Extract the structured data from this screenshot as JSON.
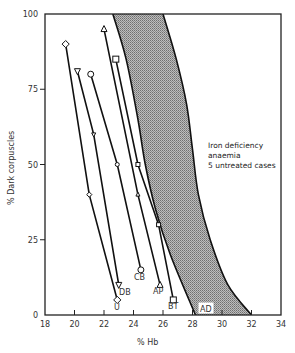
{
  "chart_data": {
    "type": "line",
    "title": "",
    "xlabel": "% Hb",
    "ylabel": "% Dark corpuscles",
    "xlim": [
      18,
      34
    ],
    "ylim": [
      0,
      100
    ],
    "xticks": [
      18,
      20,
      22,
      24,
      26,
      28,
      30,
      32,
      34
    ],
    "yticks": [
      0,
      25,
      50,
      75,
      100
    ],
    "grid": false,
    "series": [
      {
        "name": "U",
        "marker": "diamond",
        "points": [
          [
            19.4,
            90
          ],
          [
            21.0,
            40
          ],
          [
            22.9,
            5
          ]
        ]
      },
      {
        "name": "DB",
        "marker": "triangle-down",
        "points": [
          [
            20.2,
            81
          ],
          [
            21.3,
            60
          ],
          [
            23.0,
            10
          ]
        ]
      },
      {
        "name": "CB",
        "marker": "circle",
        "points": [
          [
            21.1,
            80
          ],
          [
            22.9,
            50
          ],
          [
            24.5,
            15
          ]
        ]
      },
      {
        "name": "AP",
        "marker": "triangle",
        "points": [
          [
            22.0,
            95
          ],
          [
            24.3,
            40
          ],
          [
            25.8,
            10
          ]
        ]
      },
      {
        "name": "BT",
        "marker": "square",
        "points": [
          [
            22.8,
            85
          ],
          [
            24.3,
            50
          ],
          [
            25.7,
            30
          ],
          [
            26.7,
            5
          ]
        ]
      }
    ],
    "shaded_region": {
      "name": "AD",
      "description": "Iron deficiency anaemia, 5 untreated cases",
      "left_edge": [
        [
          22.6,
          100
        ],
        [
          23.5,
          85
        ],
        [
          24.3,
          65
        ],
        [
          24.8,
          50
        ],
        [
          25.5,
          35
        ],
        [
          26.5,
          20
        ],
        [
          28.2,
          0
        ]
      ],
      "right_edge": [
        [
          26.0,
          100
        ],
        [
          26.9,
          85
        ],
        [
          27.6,
          70
        ],
        [
          28.0,
          55
        ],
        [
          28.4,
          40
        ],
        [
          29.2,
          25
        ],
        [
          30.4,
          10
        ],
        [
          32.0,
          0
        ]
      ],
      "fill": "#9a9a9a"
    },
    "annotations": [
      {
        "text": "Iron deficiency",
        "x": 28.6,
        "y": 52
      },
      {
        "text": "anaemia",
        "x": 28.6,
        "y": 47.5
      },
      {
        "text": "5 untreated cases",
        "x": 28.6,
        "y": 43
      }
    ]
  },
  "labels": {
    "xlabel": "% Hb",
    "ylabel": "% Dark corpuscles",
    "annotation_line1": "Iron deficiency",
    "annotation_line2": "anaemia",
    "annotation_line3": "5 untreated cases",
    "region_label": "AD",
    "y100": "100",
    "y75": "75",
    "y50": "50",
    "y25": "25",
    "y0": "0",
    "x18": "18",
    "x20": "20",
    "x22": "22",
    "x24": "24",
    "x26": "26",
    "x28": "28",
    "x30": "30",
    "x32": "32",
    "x34": "34",
    "sU": "U",
    "sDB": "DB",
    "sCB": "CB",
    "sAP": "AP",
    "sBT": "BT"
  }
}
